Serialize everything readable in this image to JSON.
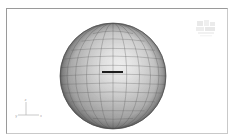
{
  "app": {
    "viewport_label": "3D viewport",
    "background_color": "#ffffff",
    "frame_color": "#9a9a9a"
  },
  "scene": {
    "object_name": "sphere",
    "shading_mode": "shaded-wireframe",
    "surface_color": "#a8a8a8",
    "highlight_color": "#e8e8e8",
    "shadow_color": "#585858",
    "wireframe_color": "#6e6e6e",
    "selected_edge_color": "#1a1a1a",
    "center_x": 56,
    "center_y": 56,
    "radius": 53,
    "meridian_count": 12,
    "parallel_count": 10,
    "selected_edge": {
      "label": "selected-edge",
      "x1": 45,
      "x2": 66,
      "y": 52
    }
  },
  "axis_tripod": {
    "label": "axis-tripod",
    "x_label": "x",
    "y_label": "y",
    "z_label": "z",
    "color": "#777777"
  },
  "watermark": {
    "label": "watermark-logo",
    "color": "#9b9b9b"
  }
}
